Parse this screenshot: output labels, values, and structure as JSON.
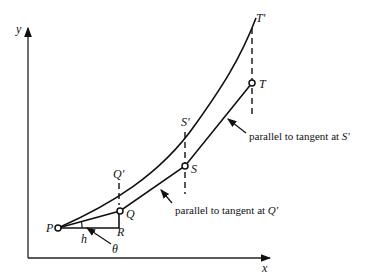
{
  "diagram": {
    "axes": {
      "x_label": "x",
      "y_label": "y"
    },
    "points": {
      "P": "P",
      "Q": "Q",
      "Q_prime": "Q'",
      "R": "R",
      "S": "S",
      "S_prime": "S'",
      "T": "T",
      "T_prime": "T'"
    },
    "segment_labels": {
      "h": "h",
      "theta": "θ"
    },
    "annotations": {
      "s_prime": {
        "text": "parallel to tangent at ",
        "point": "S'"
      },
      "q_prime": {
        "text": "parallel to tangent at ",
        "point": "Q'"
      }
    }
  }
}
